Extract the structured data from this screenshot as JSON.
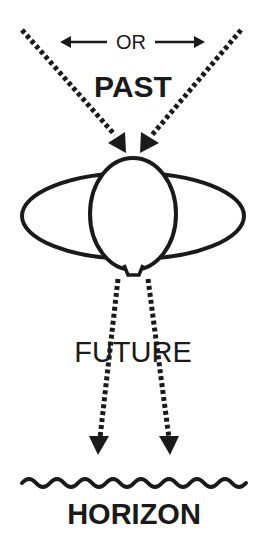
{
  "diagram": {
    "labels": {
      "or": "OR",
      "past": "PAST",
      "future": "FUTURE",
      "horizon": "HORIZON",
      "wave": "~~~~~~~~"
    },
    "colors": {
      "ink": "#1a1a1a",
      "background": "#ffffff"
    },
    "elements": [
      {
        "name": "left-incoming-dotted-arrow",
        "direction": "down-right",
        "from": "top-left",
        "to": "eye"
      },
      {
        "name": "right-incoming-dotted-arrow",
        "direction": "down-left",
        "from": "top-right",
        "to": "eye"
      },
      {
        "name": "or-double-arrow",
        "direction": "left-right"
      },
      {
        "name": "eye",
        "shape": "horizontal ellipse with vertical oval pupil"
      },
      {
        "name": "left-outgoing-dotted-arrow",
        "direction": "down",
        "to": "horizon"
      },
      {
        "name": "right-outgoing-dotted-arrow",
        "direction": "down",
        "to": "horizon"
      },
      {
        "name": "horizon-wave-line",
        "count": 8
      }
    ]
  }
}
